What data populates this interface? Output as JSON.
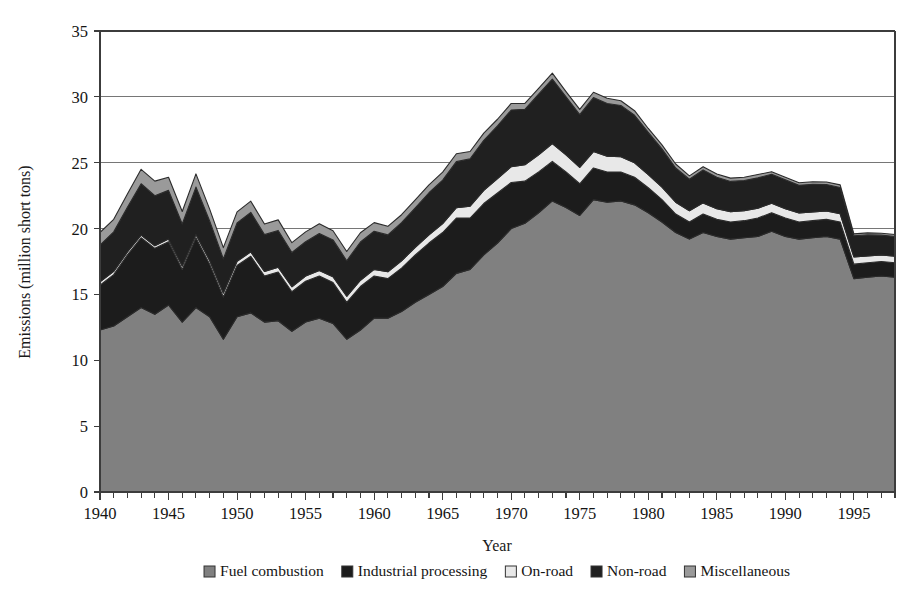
{
  "chart_data": {
    "type": "area",
    "stacked": true,
    "title": "",
    "xlabel": "Year",
    "ylabel": "Emissions (million short tons)",
    "xlim": [
      1940,
      1998
    ],
    "ylim": [
      0,
      35
    ],
    "ytick_step": 5,
    "yticks": [
      0,
      5,
      10,
      15,
      20,
      25,
      30,
      35
    ],
    "ytick_labels": [
      "0",
      "5",
      "10",
      "15",
      "20",
      "25",
      "30",
      "35"
    ],
    "xticks_labeled": [
      1940,
      1945,
      1950,
      1955,
      1960,
      1965,
      1970,
      1975,
      1980,
      1985,
      1990,
      1995
    ],
    "xtick_labels": [
      "1940",
      "1945",
      "1950",
      "1955",
      "1960",
      "1965",
      "1970",
      "1975",
      "1980",
      "1985",
      "1990",
      "1995"
    ],
    "xtick_minor_step": 1,
    "grid": "horizontal",
    "legend_position": "bottom",
    "x": [
      1940,
      1941,
      1942,
      1943,
      1944,
      1945,
      1946,
      1947,
      1948,
      1949,
      1950,
      1951,
      1952,
      1953,
      1954,
      1955,
      1956,
      1957,
      1958,
      1959,
      1960,
      1961,
      1962,
      1963,
      1964,
      1965,
      1966,
      1967,
      1968,
      1969,
      1970,
      1971,
      1972,
      1973,
      1974,
      1975,
      1976,
      1977,
      1978,
      1979,
      1980,
      1981,
      1982,
      1983,
      1984,
      1985,
      1986,
      1987,
      1988,
      1989,
      1990,
      1991,
      1992,
      1993,
      1994,
      1995,
      1996,
      1997,
      1998
    ],
    "series": [
      {
        "name": "Fuel combustion",
        "color": "#808080",
        "values": [
          12.3,
          12.6,
          13.3,
          14.0,
          13.5,
          14.2,
          12.9,
          14.0,
          13.3,
          11.6,
          13.3,
          13.6,
          12.9,
          13.0,
          12.2,
          12.9,
          13.2,
          12.8,
          11.6,
          12.3,
          13.2,
          13.2,
          13.7,
          14.4,
          15.0,
          15.6,
          16.6,
          16.9,
          18.0,
          18.9,
          20.0,
          20.4,
          21.2,
          22.1,
          21.6,
          21.0,
          22.2,
          22.0,
          22.1,
          21.8,
          21.2,
          20.5,
          19.7,
          19.2,
          19.7,
          19.4,
          19.2,
          19.3,
          19.4,
          19.8,
          19.4,
          19.2,
          19.3,
          19.4,
          19.2,
          16.2,
          16.3,
          16.4,
          16.3
        ]
      },
      {
        "name": "Industrial processing",
        "color": "#1c1c1c",
        "values": [
          3.4,
          3.9,
          4.7,
          5.3,
          5.0,
          4.8,
          4.0,
          5.3,
          4.0,
          3.2,
          3.9,
          4.3,
          3.5,
          3.7,
          3.0,
          3.1,
          3.2,
          3.1,
          2.8,
          3.3,
          3.2,
          3.0,
          3.3,
          3.6,
          3.9,
          4.1,
          4.2,
          3.9,
          3.9,
          3.8,
          3.5,
          3.2,
          3.1,
          3.0,
          2.7,
          2.4,
          2.4,
          2.3,
          2.2,
          2.1,
          1.9,
          1.7,
          1.4,
          1.3,
          1.4,
          1.3,
          1.3,
          1.3,
          1.4,
          1.4,
          1.4,
          1.3,
          1.3,
          1.3,
          1.3,
          1.1,
          1.1,
          1.1,
          1.1
        ]
      },
      {
        "name": "On-road",
        "color": "#e8e8e8",
        "values": [
          0.25,
          0.25,
          0.22,
          0.2,
          0.2,
          0.2,
          0.25,
          0.25,
          0.28,
          0.3,
          0.32,
          0.33,
          0.34,
          0.36,
          0.38,
          0.4,
          0.42,
          0.44,
          0.46,
          0.48,
          0.5,
          0.52,
          0.55,
          0.58,
          0.62,
          0.68,
          0.78,
          0.9,
          1.0,
          1.1,
          1.2,
          1.25,
          1.3,
          1.35,
          1.3,
          1.25,
          1.25,
          1.2,
          1.15,
          1.1,
          1.0,
          0.95,
          0.9,
          0.85,
          0.85,
          0.8,
          0.78,
          0.75,
          0.75,
          0.72,
          0.7,
          0.68,
          0.66,
          0.64,
          0.62,
          0.55,
          0.52,
          0.5,
          0.5
        ]
      },
      {
        "name": "Non-road",
        "color": "#202020",
        "values": [
          2.8,
          3.0,
          3.4,
          3.9,
          3.8,
          3.7,
          3.2,
          3.6,
          3.0,
          2.6,
          2.9,
          3.0,
          2.8,
          2.8,
          2.6,
          2.6,
          2.8,
          2.8,
          2.7,
          2.9,
          2.9,
          2.8,
          2.9,
          3.0,
          3.2,
          3.3,
          3.5,
          3.6,
          3.8,
          4.0,
          4.3,
          4.2,
          4.6,
          4.9,
          4.4,
          4.0,
          4.1,
          4.0,
          3.9,
          3.6,
          3.2,
          2.9,
          2.6,
          2.4,
          2.5,
          2.4,
          2.3,
          2.3,
          2.3,
          2.2,
          2.2,
          2.1,
          2.1,
          2.0,
          2.0,
          1.6,
          1.6,
          1.5,
          1.5
        ]
      },
      {
        "name": "Miscellaneous",
        "color": "#9a9a9a",
        "values": [
          0.95,
          0.95,
          1.0,
          1.1,
          1.1,
          1.0,
          0.95,
          1.0,
          0.9,
          0.85,
          0.85,
          0.85,
          0.8,
          0.8,
          0.75,
          0.75,
          0.75,
          0.7,
          0.7,
          0.7,
          0.65,
          0.65,
          0.6,
          0.6,
          0.6,
          0.6,
          0.6,
          0.55,
          0.55,
          0.5,
          0.5,
          0.45,
          0.45,
          0.45,
          0.4,
          0.4,
          0.4,
          0.4,
          0.35,
          0.35,
          0.3,
          0.3,
          0.3,
          0.25,
          0.25,
          0.25,
          0.25,
          0.25,
          0.25,
          0.2,
          0.2,
          0.2,
          0.2,
          0.2,
          0.2,
          0.15,
          0.15,
          0.15,
          0.15
        ]
      }
    ]
  },
  "legend": {
    "items": [
      {
        "label": "Fuel combustion",
        "color": "#808080"
      },
      {
        "label": "Industrial processing",
        "color": "#1c1c1c"
      },
      {
        "label": "On-road",
        "color": "#e8e8e8"
      },
      {
        "label": "Non-road",
        "color": "#202020"
      },
      {
        "label": "Miscellaneous",
        "color": "#9a9a9a"
      }
    ]
  },
  "plot_area": {
    "left": 100,
    "top": 31,
    "right": 895,
    "bottom": 492
  },
  "colors": {
    "axis": "#3c3c3c",
    "grid": "#767676",
    "text": "#141414",
    "background": "#ffffff"
  }
}
